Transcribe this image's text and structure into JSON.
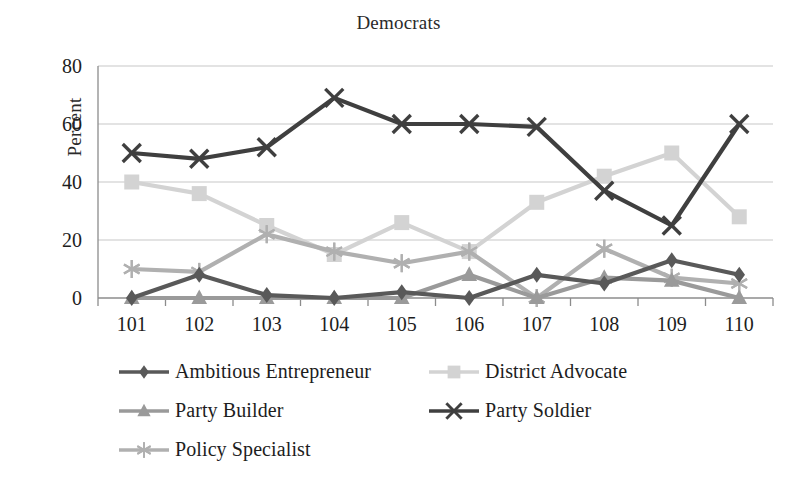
{
  "chart_data": {
    "type": "line",
    "title": "Democrats",
    "xlabel": "",
    "ylabel": "Percent",
    "categories": [
      "101",
      "102",
      "103",
      "104",
      "105",
      "106",
      "107",
      "108",
      "109",
      "110"
    ],
    "ylim": [
      0,
      80
    ],
    "yticks": [
      0,
      20,
      40,
      60,
      80
    ],
    "grid": "horizontal",
    "legend_position": "bottom",
    "series": [
      {
        "name": "Ambitious Entrepreneur",
        "marker": "diamond",
        "color": "#595959",
        "values": [
          0,
          8,
          1,
          0,
          2,
          0,
          8,
          5,
          13,
          8
        ]
      },
      {
        "name": "District Advocate",
        "marker": "square",
        "color": "#d3d3d3",
        "values": [
          40,
          36,
          25,
          15,
          26,
          16,
          33,
          42,
          50,
          28
        ]
      },
      {
        "name": "Party Builder",
        "marker": "triangle",
        "color": "#9a9a9a",
        "values": [
          0,
          0,
          0,
          0,
          0,
          8,
          0,
          7,
          6,
          0
        ]
      },
      {
        "name": "Party Soldier",
        "marker": "x",
        "color": "#3f3f3f",
        "values": [
          50,
          48,
          52,
          69,
          60,
          60,
          59,
          37,
          25,
          60
        ]
      },
      {
        "name": "Policy Specialist",
        "marker": "asterisk",
        "color": "#b0b0b0",
        "values": [
          10,
          9,
          22,
          16,
          12,
          16,
          0,
          17,
          7,
          5
        ]
      }
    ]
  },
  "colors": {
    "gridline": "#c8c8c8",
    "axis": "#8c8c8c",
    "text": "#1d1d1d",
    "background": "#ffffff"
  }
}
